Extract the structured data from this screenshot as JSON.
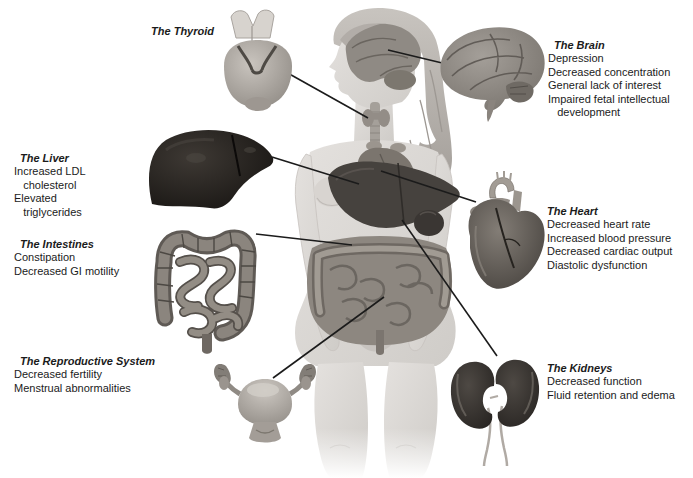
{
  "palette": {
    "background": "#ffffff",
    "text": "#1b1b1b",
    "connector_line": "#1b1b1b"
  },
  "sections": {
    "thyroid": {
      "title": "The Thyroid",
      "items": []
    },
    "brain": {
      "title": "The Brain",
      "items": [
        "Depression",
        "Decreased concentration",
        "General lack of interest",
        "Impaired fetal intellectual",
        "   development"
      ]
    },
    "liver": {
      "title": "The Liver",
      "items": [
        "Increased LDL",
        "   cholesterol",
        "Elevated",
        "   triglycerides"
      ]
    },
    "intestines": {
      "title": "The Intestines",
      "items": [
        "Constipation",
        "Decreased GI motility"
      ]
    },
    "reproductive": {
      "title": "The Reproductive System",
      "items": [
        "Decreased fertility",
        "Menstrual abnormalities"
      ]
    },
    "heart": {
      "title": "The Heart",
      "items": [
        "Decreased heart rate",
        "Increased blood pressure",
        "Decreased cardiac output",
        "Diastolic dysfunction"
      ]
    },
    "kidneys": {
      "title": "The Kidneys",
      "items": [
        "Decreased function",
        "Fluid retention and edema"
      ]
    }
  },
  "illustrations": {
    "body": "female-figure-with-internal-organs",
    "thyroid": "thyroid-gland",
    "brain": "brain-lateral-view",
    "liver": "liver",
    "intestines": "colon-and-small-intestine",
    "reproductive": "uterus-with-ovaries",
    "heart": "anatomical-heart",
    "kidneys": "pair-of-kidneys-with-ureters"
  }
}
